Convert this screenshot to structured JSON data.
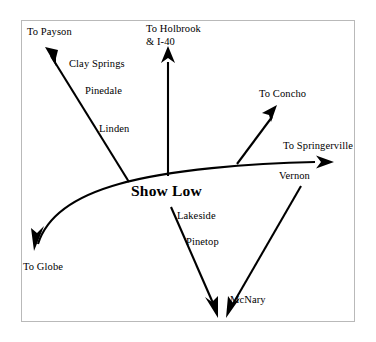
{
  "diagram": {
    "title_label": "Show Low",
    "center_city": "Show Low",
    "frame_color": "#b9b9b9",
    "ink_color": "#000000",
    "background_color": "#ffffff",
    "destinations": [
      {
        "id": "payson",
        "label": "To Payson",
        "x": 27,
        "y": 32
      },
      {
        "id": "holbrook",
        "label": "To Holbrook",
        "x": 146,
        "y": 29
      },
      {
        "id": "holbrook_i40",
        "label": "& I-40",
        "x": 146,
        "y": 41
      },
      {
        "id": "concho",
        "label": "To Concho",
        "x": 259,
        "y": 88
      },
      {
        "id": "springerville",
        "label": "To Springerville",
        "x": 283,
        "y": 140
      },
      {
        "id": "globe",
        "label": "To Globe",
        "x": 23,
        "y": 261
      }
    ],
    "towns": [
      {
        "id": "clay-springs",
        "label": "Clay Springs",
        "x": 69,
        "y": 58
      },
      {
        "id": "pinedale",
        "label": "Pinedale",
        "x": 85,
        "y": 85
      },
      {
        "id": "linden",
        "label": "Linden",
        "x": 99,
        "y": 123
      },
      {
        "id": "vernon",
        "label": "Vernon",
        "x": 279,
        "y": 170
      },
      {
        "id": "lakeside",
        "label": "Lakeside",
        "x": 177,
        "y": 210
      },
      {
        "id": "pinetop",
        "label": "Pinetop",
        "x": 186,
        "y": 236
      },
      {
        "id": "mcnary",
        "label": "McNary",
        "x": 230,
        "y": 295
      }
    ],
    "roads": [
      {
        "id": "main-highway",
        "name": "Show Low main east-west highway",
        "from": "To Globe",
        "to": "To Springerville"
      },
      {
        "id": "payson-road",
        "name": "Payson road",
        "from": "Show Low",
        "to": "To Payson"
      },
      {
        "id": "holbrook-road",
        "name": "Holbrook and I-40 road",
        "from": "Show Low",
        "to": "To Holbrook & I-40"
      },
      {
        "id": "concho-road",
        "name": "Concho road",
        "from": "main-highway",
        "to": "To Concho"
      },
      {
        "id": "lakeside-road",
        "name": "Lakeside and Pinetop road",
        "from": "Show Low",
        "to": "McNary"
      },
      {
        "id": "vernon-road",
        "name": "Vernon road",
        "from": "main-highway",
        "to": "McNary"
      }
    ]
  }
}
